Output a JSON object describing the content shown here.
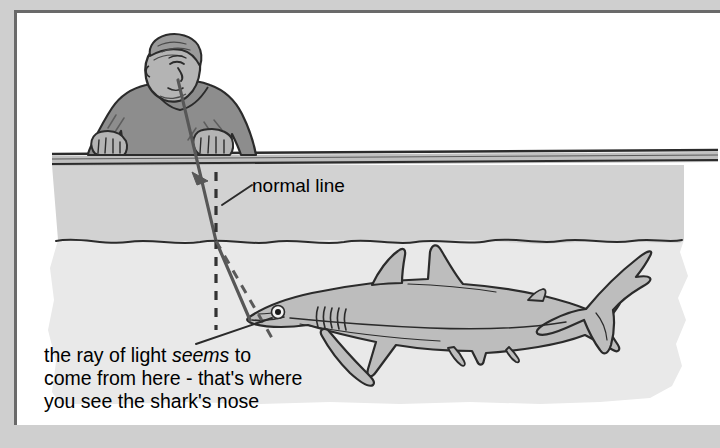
{
  "page": {
    "background_color": "#cfcfcf",
    "panel_color": "#ffffff",
    "frame_color": "#6a6a6a"
  },
  "diagram": {
    "title_visible": false,
    "labels": {
      "normal_line": "normal line",
      "caption_line_1": "the ray of light ",
      "caption_line_1_em": "seems",
      "caption_line_1_tail": " to",
      "caption_line_2": "come from here - that's where",
      "caption_line_3": "you see the shark's nose"
    },
    "colors": {
      "water_upper": "#d2d2d2",
      "water_lower": "#e9e9e9",
      "person_clothing": "#8d8d8d",
      "person_skin": "#b4b4b4",
      "shark_body": "#bdbdbd",
      "ink": "#2b2b2b",
      "ray": "#575757"
    },
    "elements": {
      "observer": "person-leaning-on-railing",
      "eye_ray": "solid-ray-with-arrowhead",
      "normal": "vertical-dashed-line",
      "apparent_ray": "dashed-virtual-ray",
      "animal": "shark",
      "water_surface": "horizontal-surface-lines",
      "seabed_boundary": "wavy-line"
    }
  }
}
